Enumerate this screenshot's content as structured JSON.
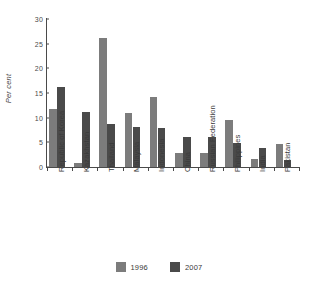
{
  "chart_data": {
    "type": "bar",
    "title": "",
    "subtitle": "",
    "xlabel": "",
    "ylabel": "Per cent",
    "ylim": [
      0,
      30
    ],
    "yticks": [
      0,
      5,
      10,
      15,
      20,
      25,
      30
    ],
    "ytick_labels": [
      "0",
      "5",
      "10",
      "15",
      "20",
      "25",
      "30"
    ],
    "grid": false,
    "legend_position": "bottom-center",
    "categories": [
      "Republic of Korea",
      "Kazakhstan",
      "Thailand",
      "Malaysia",
      "Indonesia",
      "China",
      "Russian Federation",
      "Philippines",
      "India",
      "Pakistan"
    ],
    "series": [
      {
        "name": "1996",
        "color": "#7c7c7c",
        "values": [
          11.8,
          0.9,
          26.1,
          10.9,
          14.1,
          2.9,
          2.9,
          9.6,
          1.7,
          4.7
        ]
      },
      {
        "name": "2007",
        "color": "#4a4a4a",
        "values": [
          16.3,
          11.2,
          8.7,
          8.1,
          8.0,
          6.1,
          6.0,
          4.9,
          3.8,
          1.4
        ]
      }
    ]
  },
  "legend": {
    "items": [
      {
        "label": "1996",
        "color": "#7c7c7c"
      },
      {
        "label": "2007",
        "color": "#4a4a4a"
      }
    ]
  }
}
